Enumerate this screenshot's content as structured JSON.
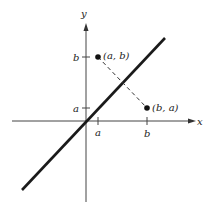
{
  "diagram": {
    "axes": {
      "x_label": "x",
      "y_label": "y"
    },
    "ticks": {
      "x": [
        {
          "label": "a"
        },
        {
          "label": "b"
        }
      ],
      "y": [
        {
          "label": "a"
        },
        {
          "label": "b"
        }
      ]
    },
    "points": [
      {
        "label": "(a, b)"
      },
      {
        "label": "(b, a)"
      }
    ],
    "line": {
      "name": "y = x"
    },
    "colors": {
      "ink": "#1a1a1a",
      "axis": "#444444"
    }
  }
}
